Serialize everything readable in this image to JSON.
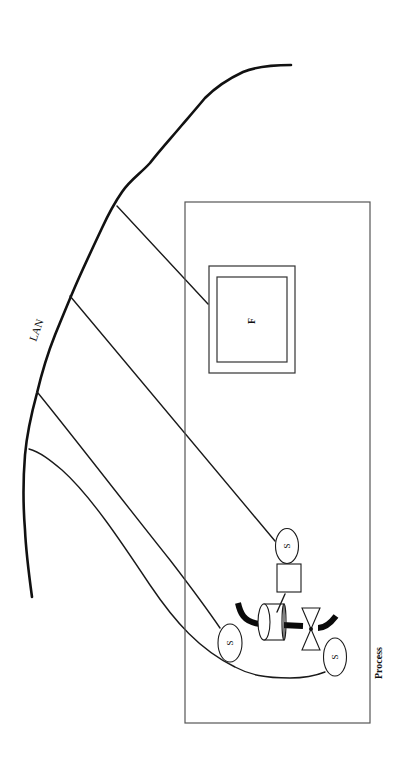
{
  "diagram": {
    "labels": {
      "lan": "LAN",
      "process": "Process",
      "field_station": "F",
      "sensor_top": "S",
      "sensor_left": "S",
      "sensor_bottom_right": "S"
    },
    "colors": {
      "line": "#111111",
      "box_border": "#555555",
      "background": "#ffffff"
    },
    "components": [
      {
        "id": "lan-bus",
        "type": "network-line",
        "label": "LAN"
      },
      {
        "id": "process-boundary",
        "type": "rectangle",
        "label": "Process"
      },
      {
        "id": "field-station",
        "type": "double-box",
        "label": "F"
      },
      {
        "id": "sensor-top",
        "type": "ellipse",
        "label": "S"
      },
      {
        "id": "actuator",
        "type": "square"
      },
      {
        "id": "pump-cylinder",
        "type": "cylinder"
      },
      {
        "id": "valve",
        "type": "bowtie-valve"
      },
      {
        "id": "pipe",
        "type": "thick-pipe"
      },
      {
        "id": "sensor-left",
        "type": "ellipse",
        "label": "S"
      },
      {
        "id": "sensor-bottom-right",
        "type": "ellipse",
        "label": "S"
      }
    ],
    "connections": [
      {
        "from": "lan-bus",
        "to": "field-station"
      },
      {
        "from": "lan-bus",
        "to": "sensor-top"
      },
      {
        "from": "lan-bus",
        "to": "sensor-left"
      },
      {
        "from": "lan-bus",
        "to": "sensor-bottom-right"
      },
      {
        "from": "actuator",
        "to": "pump-cylinder"
      }
    ]
  }
}
